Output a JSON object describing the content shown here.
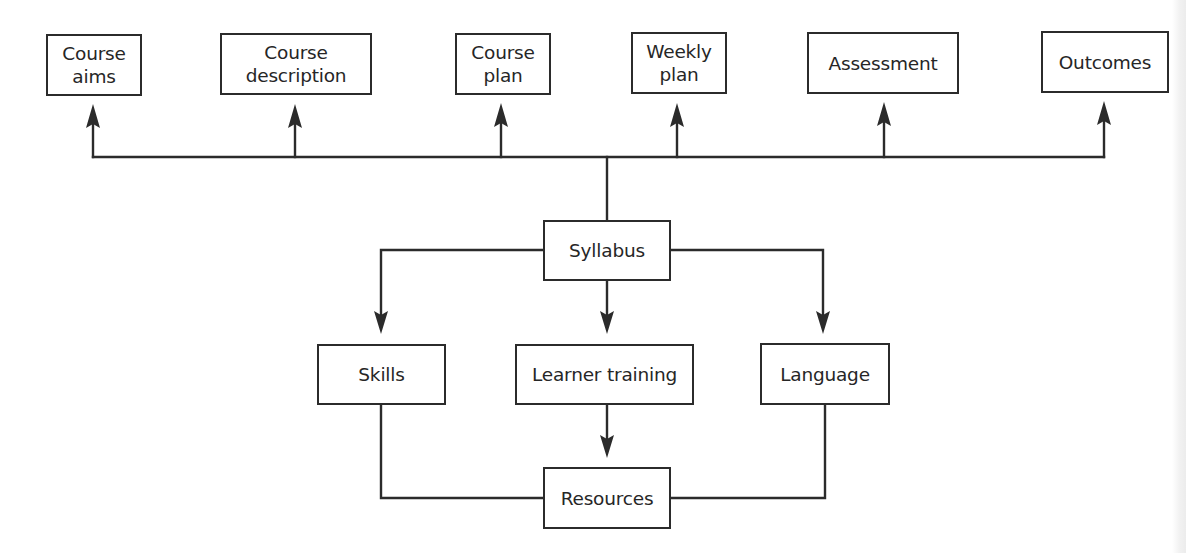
{
  "diagram": {
    "type": "flowchart",
    "line_color": "#2b2b2b",
    "text_color": "#262626",
    "top_row": [
      {
        "id": "course-aims",
        "label": "Course\naims"
      },
      {
        "id": "course-description",
        "label": "Course\ndescription"
      },
      {
        "id": "course-plan",
        "label": "Course\nplan"
      },
      {
        "id": "weekly-plan",
        "label": "Weekly\nplan"
      },
      {
        "id": "assessment",
        "label": "Assessment"
      },
      {
        "id": "outcomes",
        "label": "Outcomes"
      }
    ],
    "center": {
      "id": "syllabus",
      "label": "Syllabus"
    },
    "middle_row": [
      {
        "id": "skills",
        "label": "Skills"
      },
      {
        "id": "learner-training",
        "label": "Learner training"
      },
      {
        "id": "language",
        "label": "Language"
      }
    ],
    "bottom": {
      "id": "resources",
      "label": "Resources"
    },
    "edges": [
      {
        "from": "syllabus",
        "to": "course-aims",
        "arrow": true
      },
      {
        "from": "syllabus",
        "to": "course-description",
        "arrow": true
      },
      {
        "from": "syllabus",
        "to": "course-plan",
        "arrow": true
      },
      {
        "from": "syllabus",
        "to": "weekly-plan",
        "arrow": true
      },
      {
        "from": "syllabus",
        "to": "assessment",
        "arrow": true
      },
      {
        "from": "syllabus",
        "to": "outcomes",
        "arrow": true
      },
      {
        "from": "syllabus",
        "to": "skills",
        "arrow": true
      },
      {
        "from": "syllabus",
        "to": "learner-training",
        "arrow": true
      },
      {
        "from": "syllabus",
        "to": "language",
        "arrow": true
      },
      {
        "from": "learner-training",
        "to": "resources",
        "arrow": true
      },
      {
        "from": "skills",
        "to": "resources",
        "arrow": false
      },
      {
        "from": "language",
        "to": "resources",
        "arrow": false
      }
    ]
  }
}
